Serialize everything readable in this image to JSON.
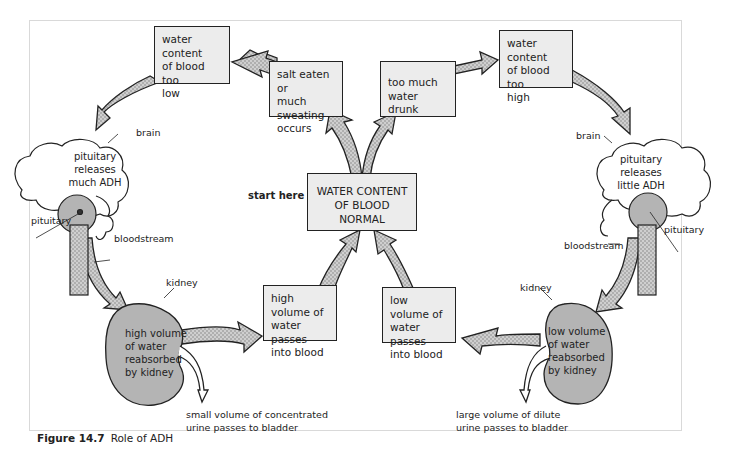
{
  "diagram": {
    "title": "Role of ADH",
    "figure_label": "Figure 14.7",
    "start_label": "start here",
    "center": "WATER CONTENT OF BLOOD NORMAL",
    "center_lines": [
      "WATER CONTENT",
      "OF BLOOD",
      "NORMAL"
    ],
    "left_loop": {
      "cause": [
        "salt eaten or",
        "much sweating",
        "occurs"
      ],
      "state": [
        "water content",
        "of blood too",
        "low"
      ],
      "brain_label": "brain",
      "brain_text": [
        "pituitary releases",
        "much ADH"
      ],
      "pituitary_label": "pituitary",
      "bloodstream_label": "bloodstream",
      "kidney_label": "kidney",
      "kidney_text": [
        "high volume",
        "of water",
        "reabsorbed",
        "by kidney"
      ],
      "result": [
        "high volume of",
        "water passes",
        "into blood"
      ],
      "urine": [
        "small volume of concentrated",
        "urine passes to bladder"
      ]
    },
    "right_loop": {
      "cause": [
        "too much",
        "water drunk"
      ],
      "state": [
        "water content",
        "of blood too",
        "high"
      ],
      "brain_label": "brain",
      "brain_text": [
        "pituitary releases",
        "little ADH"
      ],
      "pituitary_label": "pituitary",
      "bloodstream_label": "bloodstream",
      "kidney_label": "kidney",
      "kidney_text": [
        "low volume",
        "of water",
        "reabsorbed",
        "by kidney"
      ],
      "result": [
        "low volume of",
        "water passes",
        "into blood"
      ],
      "urine": [
        "large volume of dilute",
        "urine passes to bladder"
      ]
    },
    "colors": {
      "box_fill": "#ececec",
      "arrow_fill": "#c8c8c8",
      "organ_fill": "#b4b4b4",
      "stroke": "#222222"
    }
  }
}
